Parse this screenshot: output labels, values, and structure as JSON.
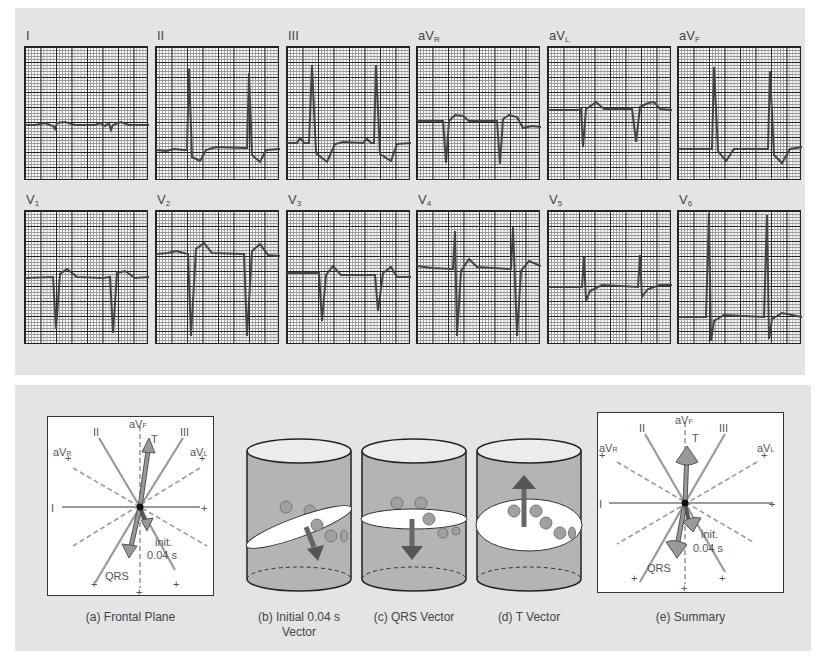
{
  "ecg": {
    "row1": [
      {
        "label": "I",
        "sub": ""
      },
      {
        "label": "II",
        "sub": ""
      },
      {
        "label": "III",
        "sub": ""
      },
      {
        "label": "aV",
        "sub": "R"
      },
      {
        "label": "aV",
        "sub": "L"
      },
      {
        "label": "aV",
        "sub": "F"
      }
    ],
    "row2": [
      {
        "label": "V",
        "sub": "1"
      },
      {
        "label": "V",
        "sub": "2"
      },
      {
        "label": "V",
        "sub": "3"
      },
      {
        "label": "V",
        "sub": "4"
      },
      {
        "label": "V",
        "sub": "5"
      },
      {
        "label": "V",
        "sub": "6"
      }
    ]
  },
  "frontal": {
    "axes": {
      "I": "I",
      "II": "II",
      "III": "III",
      "aVR": "aV",
      "aVR_sub": "R",
      "aVL": "aV",
      "aVL_sub": "L",
      "aVF": "aV",
      "aVF_sub": "F"
    },
    "plus": "+",
    "t_label": "T",
    "qrs_label": "QRS",
    "init_label": "init.",
    "init_time": "0.04 s"
  },
  "captions": {
    "a": "(a)  Frontal Plane",
    "b1": "(b)  Initial  0.04 s",
    "b2": "Vector",
    "c": "(c)  QRS Vector",
    "d": "(d)  T Vector",
    "e": "(e)  Summary"
  },
  "colors": {
    "panel": "#e4e4e4",
    "grid_major": "#222222",
    "trace": "#444444",
    "axis_line": "#9a9a9a",
    "arrow": "#8a8a8a"
  }
}
